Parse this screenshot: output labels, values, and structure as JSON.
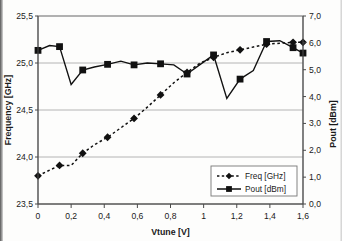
{
  "chart_data": {
    "type": "line",
    "title": "",
    "xlabel": "Vtune [V]",
    "ylabel": "Frequency [GHz]",
    "y2label": "Pout [dBm]",
    "grid": true,
    "legend_position": "bottom-right",
    "xlim": [
      0,
      1.6
    ],
    "ylim": [
      23.5,
      25.5
    ],
    "y2lim": [
      0.0,
      7.0
    ],
    "xticks": [
      "0",
      "0,2",
      "0,4",
      "0,6",
      "0,8",
      "1",
      "1,2",
      "1,4",
      "1,6"
    ],
    "xtick_values": [
      0,
      0.2,
      0.4,
      0.6,
      0.8,
      1.0,
      1.2,
      1.4,
      1.6
    ],
    "yticks": [
      "23,5",
      "24,0",
      "24,5",
      "25,0",
      "25,5"
    ],
    "ytick_values": [
      23.5,
      24.0,
      24.5,
      25.0,
      25.5
    ],
    "y2ticks": [
      "0,0",
      "1,0",
      "2,0",
      "3,0",
      "4,0",
      "5,0",
      "6,0",
      "7,0"
    ],
    "y2tick_values": [
      0,
      1,
      2,
      3,
      4,
      5,
      6,
      7
    ],
    "x": [
      0.0,
      0.07,
      0.13,
      0.2,
      0.27,
      0.34,
      0.42,
      0.5,
      0.58,
      0.66,
      0.74,
      0.82,
      0.9,
      0.98,
      1.06,
      1.14,
      1.22,
      1.3,
      1.38,
      1.46,
      1.54,
      1.6
    ],
    "series": [
      {
        "name": "Freq [GHz]",
        "axis": "left",
        "unit": "GHz",
        "marker": "diamond",
        "linestyle": "dashed",
        "values": [
          23.8,
          23.86,
          23.91,
          23.91,
          24.04,
          24.13,
          24.21,
          24.31,
          24.41,
          24.53,
          24.66,
          24.79,
          24.9,
          25.0,
          25.06,
          25.11,
          25.14,
          25.17,
          25.2,
          25.21,
          25.22,
          25.22
        ]
      },
      {
        "name": "Pout [dBm]",
        "axis": "right",
        "unit": "dBm",
        "marker": "square",
        "linestyle": "solid",
        "values": [
          5.72,
          5.9,
          5.86,
          4.45,
          4.99,
          5.1,
          5.2,
          5.32,
          5.18,
          5.25,
          5.22,
          5.18,
          4.84,
          5.2,
          5.55,
          3.93,
          4.65,
          4.97,
          6.05,
          6.08,
          5.82,
          5.62
        ]
      }
    ],
    "legend": [
      {
        "label": "Freq [GHz]",
        "marker": "diamond",
        "linestyle": "dashed"
      },
      {
        "label": "Pout [dBm]",
        "marker": "square",
        "linestyle": "solid"
      }
    ]
  }
}
